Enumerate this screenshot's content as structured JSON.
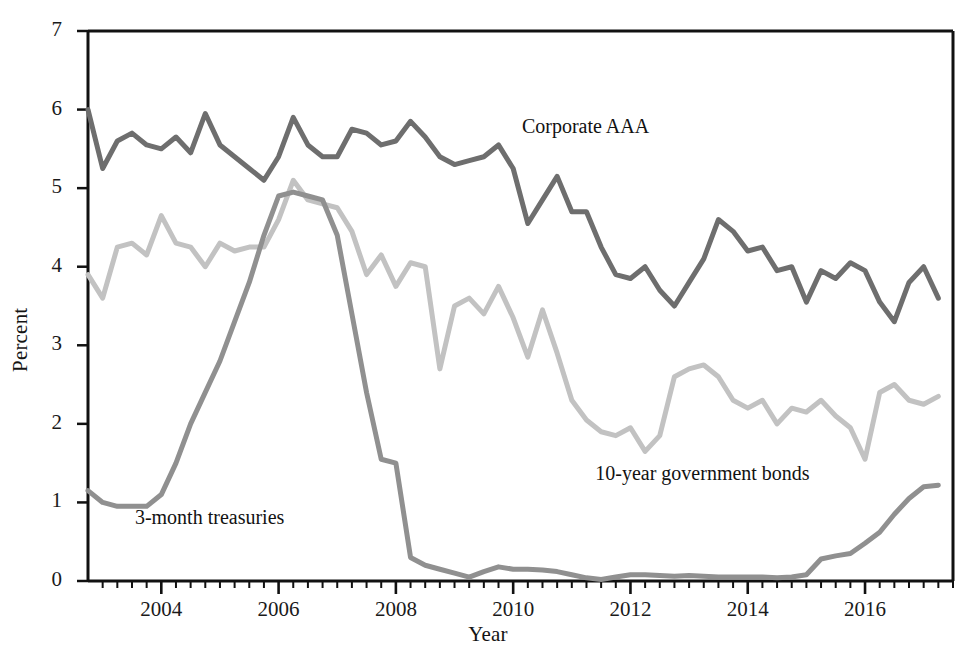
{
  "chart_data": {
    "type": "line",
    "title": "",
    "xlabel": "Year",
    "ylabel": "Percent",
    "xlim": [
      2002.75,
      2017.5
    ],
    "ylim": [
      0,
      7
    ],
    "y_ticks": [
      0,
      1,
      2,
      3,
      4,
      5,
      6,
      7
    ],
    "x_ticks_major": [
      2004,
      2006,
      2008,
      2010,
      2012,
      2014,
      2016
    ],
    "x_tick_minor_step": 0.25,
    "grid": false,
    "legend_position": "inline-annotations",
    "x": [
      2002.75,
      2003.0,
      2003.25,
      2003.5,
      2003.75,
      2004.0,
      2004.25,
      2004.5,
      2004.75,
      2005.0,
      2005.25,
      2005.5,
      2005.75,
      2006.0,
      2006.25,
      2006.5,
      2006.75,
      2007.0,
      2007.25,
      2007.5,
      2007.75,
      2008.0,
      2008.25,
      2008.5,
      2008.75,
      2009.0,
      2009.25,
      2009.5,
      2009.75,
      2010.0,
      2010.25,
      2010.5,
      2010.75,
      2011.0,
      2011.25,
      2011.5,
      2011.75,
      2012.0,
      2012.25,
      2012.5,
      2012.75,
      2013.0,
      2013.25,
      2013.5,
      2013.75,
      2014.0,
      2014.25,
      2014.5,
      2014.75,
      2015.0,
      2015.25,
      2015.5,
      2015.75,
      2016.0,
      2016.25,
      2016.5,
      2016.75,
      2017.0,
      2017.25
    ],
    "series": [
      {
        "name": "Corporate AAA",
        "color": "#6e6e6e",
        "label_x": 2010.15,
        "label_y": 5.75,
        "values": [
          6.0,
          5.25,
          5.6,
          5.7,
          5.55,
          5.5,
          5.65,
          5.45,
          5.95,
          5.55,
          5.4,
          5.25,
          5.1,
          5.4,
          5.9,
          5.55,
          5.4,
          5.4,
          5.75,
          5.7,
          5.55,
          5.6,
          5.85,
          5.65,
          5.4,
          5.3,
          5.35,
          5.4,
          5.55,
          5.25,
          4.55,
          4.85,
          5.15,
          4.7,
          4.7,
          4.25,
          3.9,
          3.85,
          4.0,
          3.7,
          3.5,
          3.8,
          4.1,
          4.6,
          4.45,
          4.2,
          4.25,
          3.95,
          4.0,
          3.55,
          3.95,
          3.85,
          4.05,
          3.95,
          3.55,
          3.3,
          3.8,
          4.0,
          3.6
        ]
      },
      {
        "name": "10-year government bonds",
        "color": "#c2c2c2",
        "label_x": 2011.4,
        "label_y": 1.34,
        "values": [
          3.9,
          3.6,
          4.25,
          4.3,
          4.15,
          4.65,
          4.3,
          4.25,
          4.0,
          4.3,
          4.2,
          4.25,
          4.25,
          4.6,
          5.1,
          4.85,
          4.8,
          4.75,
          4.45,
          3.9,
          4.15,
          3.75,
          4.05,
          4.0,
          2.7,
          3.5,
          3.6,
          3.4,
          3.75,
          3.35,
          2.85,
          3.45,
          2.9,
          2.3,
          2.05,
          1.9,
          1.85,
          1.95,
          1.65,
          1.85,
          2.6,
          2.7,
          2.75,
          2.6,
          2.3,
          2.2,
          2.3,
          2.0,
          2.2,
          2.15,
          2.3,
          2.1,
          1.95,
          1.55,
          2.4,
          2.5,
          2.3,
          2.25,
          2.35
        ]
      },
      {
        "name": "3-month treasuries",
        "color": "#909090",
        "label_x": 2003.55,
        "label_y": 0.78,
        "values": [
          1.15,
          1.0,
          0.95,
          0.95,
          0.95,
          1.1,
          1.5,
          2.0,
          2.4,
          2.8,
          3.3,
          3.8,
          4.4,
          4.9,
          4.95,
          4.9,
          4.85,
          4.4,
          3.4,
          2.4,
          1.55,
          1.5,
          0.3,
          0.2,
          0.15,
          0.1,
          0.05,
          0.12,
          0.18,
          0.15,
          0.15,
          0.14,
          0.12,
          0.08,
          0.04,
          0.02,
          0.05,
          0.08,
          0.08,
          0.07,
          0.06,
          0.07,
          0.06,
          0.05,
          0.05,
          0.05,
          0.05,
          0.04,
          0.05,
          0.08,
          0.28,
          0.32,
          0.35,
          0.48,
          0.62,
          0.85,
          1.05,
          1.2,
          1.22
        ]
      }
    ]
  },
  "axes": {
    "y_tick_labels": [
      "7",
      "6",
      "5",
      "4",
      "3",
      "2",
      "1",
      "0"
    ],
    "x_tick_labels": [
      "2004",
      "2006",
      "2008",
      "2010",
      "2012",
      "2014",
      "2016"
    ],
    "y_axis_title": "Percent",
    "x_axis_title": "Year"
  },
  "annotations": [
    {
      "text": "Corporate AAA",
      "name": "label-corporate-aaa"
    },
    {
      "text": "10-year government bonds",
      "name": "label-10-year-government-bonds"
    },
    {
      "text": "3-month treasuries",
      "name": "label-3-month-treasuries"
    }
  ]
}
